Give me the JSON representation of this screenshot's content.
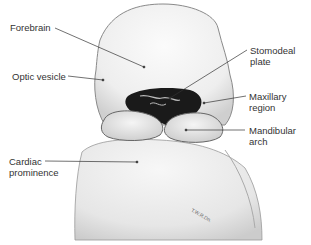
{
  "figure": {
    "labels": [
      {
        "id": "forebrain",
        "line1": "Forebrain",
        "line2": ""
      },
      {
        "id": "optic-vesicle",
        "line1": "Optic vesicle",
        "line2": ""
      },
      {
        "id": "stomodeal-plate",
        "line1": "Stomodeal",
        "line2": "plate"
      },
      {
        "id": "maxillary-region",
        "line1": "Maxillary",
        "line2": "region"
      },
      {
        "id": "mandibular-arch",
        "line1": "Mandibular",
        "line2": "arch"
      },
      {
        "id": "cardiac-prominence",
        "line1": "Cardiac",
        "line2": "prominence"
      }
    ],
    "signature": "T.W.R.Dn."
  }
}
